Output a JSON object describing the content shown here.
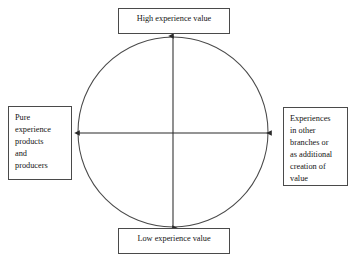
{
  "diagram": {
    "type": "axis-circle-quadrant",
    "background_color": "#ffffff",
    "stroke_color": "#4a4a4a",
    "text_color": "#141414",
    "circle": {
      "center_x": 173,
      "center_y": 132,
      "radius": 95,
      "fill": "none"
    },
    "axes": [
      {
        "name": "vertical-axis",
        "orientation": "vertical",
        "double_headed": true,
        "from_label": "Low experience value",
        "to_label": "High experience value"
      },
      {
        "name": "horizontal-axis",
        "orientation": "horizontal",
        "double_headed": true,
        "from_label": "Pure experience products and producers",
        "to_label": "Experiences in other branches or as additional creation of value"
      }
    ],
    "boxes": {
      "top": {
        "position": "top",
        "lines": [
          "High experience value"
        ]
      },
      "bottom": {
        "position": "bottom",
        "lines": [
          "Low experience value"
        ]
      },
      "left": {
        "position": "left",
        "lines": [
          "Pure",
          "experience",
          "products",
          "and",
          "producers"
        ]
      },
      "right": {
        "position": "right",
        "lines": [
          "Experiences",
          "in other",
          "branches or",
          "as additional",
          "creation of",
          "value"
        ]
      }
    }
  }
}
